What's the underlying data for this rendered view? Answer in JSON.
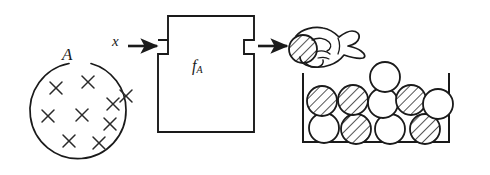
{
  "figure": {
    "type": "scientific-diagram",
    "background_color": "#ffffff",
    "ink_color": "#1a1a1a"
  },
  "labels": {
    "set_label": "A",
    "input_label": "x",
    "box_label_base": "f",
    "box_label_subscript": "A"
  },
  "diagram_data": {
    "source_set": {
      "name": "set-A-circle",
      "shape": "circle",
      "center": [
        78,
        110
      ],
      "radius": 48,
      "label": "A",
      "label_gap_at_top": true,
      "element_marks": "x",
      "element_count": 9,
      "element_positions": [
        [
          56,
          88
        ],
        [
          88,
          82
        ],
        [
          113,
          104
        ],
        [
          48,
          116
        ],
        [
          82,
          115
        ],
        [
          110,
          124
        ],
        [
          69,
          141
        ],
        [
          99,
          143
        ],
        [
          126,
          96
        ]
      ]
    },
    "input_arrow": {
      "name": "input-arrow",
      "label": "x",
      "from": [
        128,
        46
      ],
      "to": [
        158,
        46
      ],
      "direction": "right"
    },
    "function_box": {
      "name": "function-box",
      "label": "f_A",
      "x": 158,
      "y": 16,
      "width": 96,
      "height": 116,
      "notch_left_y": 40,
      "notch_right_y": 40,
      "notch_depth": 10,
      "notch_height": 14
    },
    "output_arrow": {
      "name": "output-arrow",
      "from": [
        256,
        46
      ],
      "to": [
        286,
        46
      ],
      "direction": "right"
    },
    "hand": {
      "name": "hand-holding-ball",
      "holding": "hatched-ball",
      "ball_center": [
        302,
        48
      ],
      "ball_radius": 14
    },
    "container": {
      "name": "ball-container",
      "left_wall_x": 303,
      "right_wall_x": 449,
      "floor_y": 142,
      "top_y": 74,
      "balls": [
        {
          "row": "bottom",
          "cx": 324,
          "cy": 128,
          "r": 15,
          "fill": "white"
        },
        {
          "row": "bottom",
          "cx": 355,
          "cy": 129,
          "r": 15,
          "fill": "hatched"
        },
        {
          "row": "bottom",
          "cx": 390,
          "cy": 129,
          "r": 15,
          "fill": "white"
        },
        {
          "row": "bottom",
          "cx": 425,
          "cy": 129,
          "r": 15,
          "fill": "hatched"
        },
        {
          "row": "middle",
          "cx": 322,
          "cy": 101,
          "r": 15,
          "fill": "hatched"
        },
        {
          "row": "middle",
          "cx": 352,
          "cy": 100,
          "r": 15,
          "fill": "hatched"
        },
        {
          "row": "middle",
          "cx": 382,
          "cy": 102,
          "r": 15,
          "fill": "white"
        },
        {
          "row": "middle",
          "cx": 411,
          "cy": 100,
          "r": 15,
          "fill": "hatched"
        },
        {
          "row": "middle",
          "cx": 438,
          "cy": 103,
          "r": 15,
          "fill": "white"
        },
        {
          "row": "top",
          "cx": 385,
          "cy": 77,
          "r": 15,
          "fill": "white"
        }
      ],
      "hatched_count": 5,
      "white_count": 5,
      "total_balls": 10
    }
  }
}
